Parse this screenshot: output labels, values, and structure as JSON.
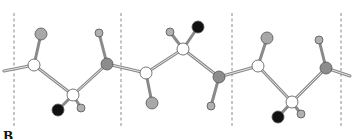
{
  "figure": {
    "panel_label": "B",
    "colors": {
      "white_atom": "#ffffff",
      "gray_atom": "#a8a8a8",
      "dark_gray_atom": "#8c8c8c",
      "black_atom": "#111111",
      "bond": "#9a9a9a",
      "divider": "#8a8a8a"
    },
    "dividers_x": [
      14,
      121,
      232,
      341
    ],
    "units": 3
  }
}
